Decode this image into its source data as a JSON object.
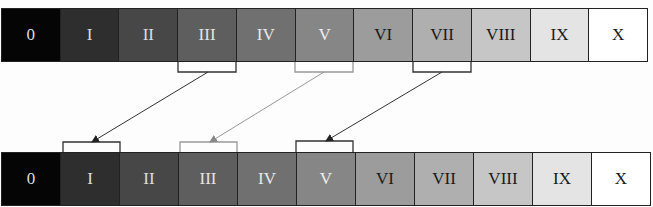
{
  "diagram": {
    "top_row": {
      "cells": [
        {
          "label": "0",
          "bg": "#050505",
          "fg": "#dddddd"
        },
        {
          "label": "I",
          "bg": "#2e2e2e",
          "fg": "#dddddd"
        },
        {
          "label": "II",
          "bg": "#474747",
          "fg": "#dddddd"
        },
        {
          "label": "III",
          "bg": "#5e5e5e",
          "fg": "#e4e4e4"
        },
        {
          "label": "IV",
          "bg": "#707070",
          "fg": "#e8e8e8"
        },
        {
          "label": "V",
          "bg": "#868686",
          "fg": "#eeeeee"
        },
        {
          "label": "VI",
          "bg": "#9c9c9c",
          "fg": "#1a1a1a"
        },
        {
          "label": "VII",
          "bg": "#afafaf",
          "fg": "#1a1a1a"
        },
        {
          "label": "VIII",
          "bg": "#c6c6c6",
          "fg": "#1a1a1a"
        },
        {
          "label": "IX",
          "bg": "#e4e4e4",
          "fg": "#1a1a1a"
        },
        {
          "label": "X",
          "bg": "#ffffff",
          "fg": "#1a1a1a"
        }
      ]
    },
    "bottom_row": {
      "cells": [
        {
          "label": "0",
          "bg": "#050505",
          "fg": "#dddddd"
        },
        {
          "label": "I",
          "bg": "#2e2e2e",
          "fg": "#dddddd"
        },
        {
          "label": "II",
          "bg": "#474747",
          "fg": "#dddddd"
        },
        {
          "label": "III",
          "bg": "#5e5e5e",
          "fg": "#e4e4e4"
        },
        {
          "label": "IV",
          "bg": "#707070",
          "fg": "#e8e8e8"
        },
        {
          "label": "V",
          "bg": "#868686",
          "fg": "#eeeeee"
        },
        {
          "label": "VI",
          "bg": "#9c9c9c",
          "fg": "#1a1a1a"
        },
        {
          "label": "VII",
          "bg": "#afafaf",
          "fg": "#1a1a1a"
        },
        {
          "label": "VIII",
          "bg": "#c6c6c6",
          "fg": "#1a1a1a"
        },
        {
          "label": "IX",
          "bg": "#e4e4e4",
          "fg": "#1a1a1a"
        },
        {
          "label": "X",
          "bg": "#ffffff",
          "fg": "#1a1a1a"
        }
      ]
    },
    "mappings": [
      {
        "from": "III",
        "to": "I",
        "color": "#333333"
      },
      {
        "from": "V",
        "to": "III",
        "color": "#888888"
      },
      {
        "from": "VII",
        "to": "V",
        "color": "#333333"
      }
    ]
  }
}
